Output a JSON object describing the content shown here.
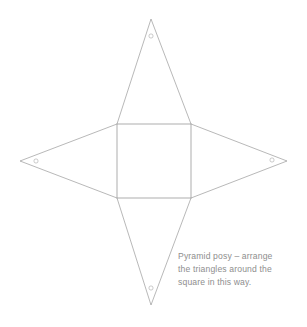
{
  "page": {
    "background_color": "#ffffff",
    "width": 307,
    "height": 327
  },
  "diagram": {
    "line_color": "#9a9a9a",
    "marker_color": "#a8a8a8",
    "square": {
      "label": "central-square",
      "x": 117,
      "y": 124,
      "width": 74,
      "height": 74
    },
    "triangles": [
      {
        "name": "top-triangle",
        "base_from": [
          117,
          124
        ],
        "base_to": [
          191,
          124
        ],
        "apex": [
          151,
          19
        ],
        "marker": [
          151,
          36
        ]
      },
      {
        "name": "left-triangle",
        "base_from": [
          117,
          124
        ],
        "base_to": [
          117,
          198
        ],
        "apex": [
          20,
          161
        ],
        "marker": [
          36,
          161
        ]
      },
      {
        "name": "right-triangle",
        "base_from": [
          191,
          124
        ],
        "base_to": [
          191,
          198
        ],
        "apex": [
          287,
          161
        ],
        "marker": [
          272,
          160
        ]
      },
      {
        "name": "bottom-triangle",
        "base_from": [
          117,
          198
        ],
        "base_to": [
          191,
          198
        ],
        "apex": [
          151,
          305
        ],
        "marker": [
          151,
          288
        ]
      }
    ],
    "marker_radius": 2.1
  },
  "caption": {
    "color": "#8e8e8e",
    "lines": [
      "Pyramid posy – arrange",
      "the triangles around the",
      "square in this way."
    ],
    "full_text": "Pyramid posy – arrange the triangles around the square in this way."
  }
}
